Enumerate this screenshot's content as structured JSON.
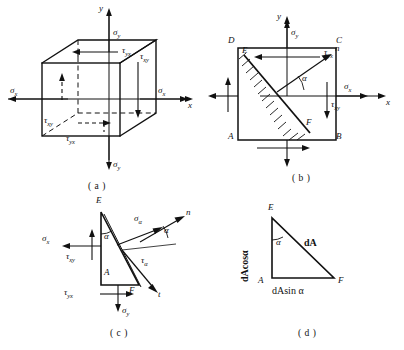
{
  "figure": {
    "title_captions": {
      "a": "( a )",
      "b": "( b )",
      "c": "( c )",
      "d": "( d )"
    },
    "panel_a": {
      "name": "three-dimensional-stress-element-cube",
      "axes": {
        "x": "x",
        "y": "y"
      },
      "labels": {
        "sigma_y_top": "σ",
        "sigma_y_top_sub": "y",
        "sigma_y_bottom": "σ",
        "sigma_y_bottom_sub": "y",
        "sigma_x_left": "σ",
        "sigma_x_left_sub": "x",
        "sigma_x_right": "σ",
        "sigma_x_right_sub": "x",
        "tau_yx_top": "τ",
        "tau_yx_top_sub": "yx",
        "tau_xy_right": "τ",
        "tau_xy_right_sub": "xy",
        "tau_xy_left": "τ",
        "tau_xy_left_sub": "xy",
        "tau_yx_bottom": "τ",
        "tau_yx_bottom_sub": "yx"
      }
    },
    "panel_b": {
      "name": "plane-stress-square-element-with-inclined-section",
      "axes": {
        "x": "x",
        "y": "y"
      },
      "corners": {
        "A": "A",
        "B": "B",
        "C": "C",
        "D": "D",
        "E": "E",
        "F": "F"
      },
      "labels": {
        "sigma_y": "σ",
        "sigma_y_sub": "y",
        "sigma_x": "σ",
        "sigma_x_sub": "x",
        "tau_yx": "τ",
        "tau_yx_sub": "yx",
        "tau_xy": "τ",
        "tau_xy_sub": "xy",
        "normal": "n",
        "alpha": "α"
      }
    },
    "panel_c": {
      "name": "triangular-wedge-free-body-diagram",
      "corners": {
        "A": "A",
        "E": "E",
        "F": "F"
      },
      "labels": {
        "sigma_x": "σ",
        "sigma_x_sub": "x",
        "tau_xy": "τ",
        "tau_xy_sub": "xy",
        "tau_yx": "τ",
        "tau_yx_sub": "yx",
        "sigma_y": "σ",
        "sigma_y_sub": "y",
        "sigma_alpha": "σ",
        "sigma_alpha_sub": "α",
        "tau_alpha": "τ",
        "tau_alpha_sub": "α",
        "normal": "n",
        "tangent": "t",
        "alpha_inner": "α",
        "alpha_outer": "α"
      }
    },
    "panel_d": {
      "name": "wedge-area-geometry-triangle",
      "corners": {
        "A": "A",
        "E": "E",
        "F": "F"
      },
      "labels": {
        "vertical_side": "dAcosα",
        "hypotenuse": "dA",
        "horizontal_side": "dAsin α",
        "alpha": "α"
      }
    },
    "style": {
      "stroke": "#111111",
      "background": "#ffffff"
    }
  }
}
